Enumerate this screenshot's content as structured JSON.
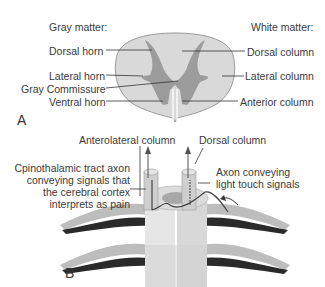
{
  "panel_a": {
    "letter": "A",
    "gray_matter_heading": "Gray matter:",
    "white_matter_heading": "White matter:",
    "gray_labels": [
      "Dorsal horn",
      "Lateral horn",
      "Gray Commissure",
      "Ventral horn"
    ],
    "white_labels": [
      "Dorsal column",
      "Lateral column",
      "Anterior column"
    ],
    "colors": {
      "white_matter": "#d9d9d9",
      "gray_matter": "#9a9a9a",
      "outline": "#888888"
    }
  },
  "panel_b": {
    "letter": "B",
    "top_labels": [
      "Anterolateral column",
      "Dorsal column"
    ],
    "left_label_lines": [
      "Cpinothalamic tract axon",
      "conveying signals that",
      "the cerebral cortex",
      "interprets as pain"
    ],
    "right_label_lines": [
      "Axon conveying",
      "light touch signals"
    ]
  }
}
